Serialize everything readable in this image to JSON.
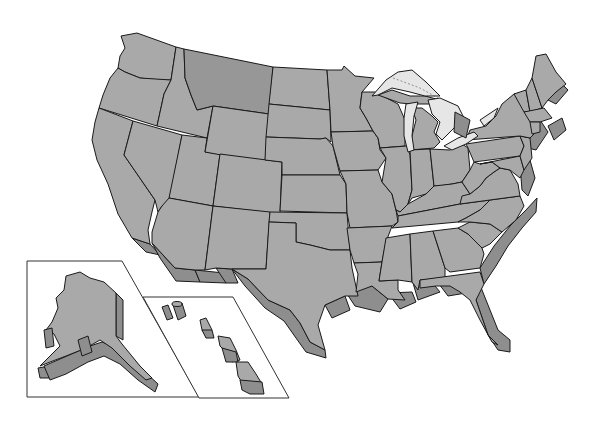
{
  "map": {
    "title": "United States",
    "style": "3D extruded state outline map, grayscale",
    "colors": {
      "background": "#ffffff",
      "state_fill": "#a9a9a9",
      "highlighted_fill": "#979797",
      "extrusion_side": "#8e8e8e",
      "lake_fill": "#e6e6e6",
      "border": "#1a1a1a",
      "inset_frame": "#333333"
    },
    "highlighted_state": "Montana",
    "insets": [
      {
        "name": "Alaska",
        "shape": "parallelogram frame"
      },
      {
        "name": "Hawaii",
        "shape": "parallelogram frame"
      }
    ],
    "features": [
      "Great Lakes",
      "state borders",
      "coastal extrusion"
    ],
    "labels": []
  }
}
